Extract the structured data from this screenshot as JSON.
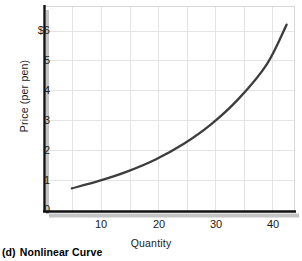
{
  "caption": {
    "number": "(d)",
    "text": "Nonlinear Curve"
  },
  "chart_data": {
    "type": "line",
    "title": "",
    "subtitle": "",
    "xlabel": "Quantity",
    "ylabel": "Price (per pen)",
    "xlim": [
      0,
      45
    ],
    "ylim": [
      0,
      6.4
    ],
    "grid": true,
    "legend": false,
    "legend_position": "none",
    "x_ticks": [
      10,
      20,
      30,
      40
    ],
    "x_tick_labels": [
      "10",
      "20",
      "30",
      "40"
    ],
    "y_ticks": [
      0,
      1,
      2,
      3,
      4,
      5,
      6
    ],
    "y_tick_labels": [
      "0",
      "1",
      "2",
      "3",
      "4",
      "5",
      "$6"
    ],
    "grid_x": [
      5,
      10,
      15,
      20,
      25,
      30,
      35,
      40
    ],
    "grid_y": [
      1,
      2,
      3,
      4,
      5,
      6
    ],
    "series": [
      {
        "name": "Nonlinear supply curve",
        "color": "#3d3d3d",
        "x": [
          5,
          10,
          15,
          20,
          25,
          30,
          35,
          40,
          43.5
        ],
        "y": [
          0.72,
          0.96,
          1.25,
          1.62,
          2.1,
          2.72,
          3.53,
          4.6,
          5.82
        ]
      }
    ],
    "annotations": []
  },
  "colors": {
    "curve": "#3d3d3d",
    "axis": "#000000",
    "grid": "#e2e2e2",
    "shadow": "#bdbdbd",
    "text": "#1a1a1a",
    "background": "#ffffff"
  }
}
